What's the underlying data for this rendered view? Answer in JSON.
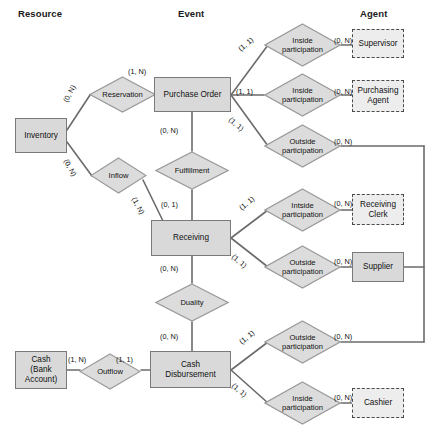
{
  "diagram": {
    "columns": [
      {
        "label": "Resource",
        "x": 18,
        "y": 8
      },
      {
        "label": "Event",
        "x": 178,
        "y": 8
      },
      {
        "label": "Agent",
        "x": 360,
        "y": 8
      }
    ],
    "colors": {
      "entity_fill": "#d9d9d9",
      "entity_border": "#7a7a7a",
      "dashed_fill": "#ededed",
      "dashed_border": "#4a4a4a",
      "diamond_fill": "#dcdcdc",
      "diamond_border": "#9a9a9a",
      "line": "#6b6b6b",
      "text": "#111111",
      "background": "#ffffff"
    },
    "entities": [
      {
        "id": "inventory",
        "label": "Inventory",
        "x": 15,
        "y": 118,
        "w": 52,
        "h": 35,
        "style": "solid"
      },
      {
        "id": "cash",
        "label": "Cash\n(Bank\nAccount)",
        "x": 15,
        "y": 351,
        "w": 52,
        "h": 38,
        "style": "solid"
      },
      {
        "id": "purchase-order",
        "label": "Purchase Order",
        "x": 154,
        "y": 77,
        "w": 77,
        "h": 35,
        "style": "solid"
      },
      {
        "id": "receiving",
        "label": "Receiving",
        "x": 151,
        "y": 220,
        "w": 80,
        "h": 36,
        "style": "solid"
      },
      {
        "id": "cash-disbursement",
        "label": "Cash\nDisbursement",
        "x": 150,
        "y": 351,
        "w": 81,
        "h": 37,
        "style": "solid"
      },
      {
        "id": "supervisor",
        "label": "Supervisor",
        "x": 352,
        "y": 29,
        "w": 52,
        "h": 29,
        "style": "dashed"
      },
      {
        "id": "purchasing-agent",
        "label": "Purchasing\nAgent",
        "x": 352,
        "y": 80,
        "w": 52,
        "h": 32,
        "style": "dashed"
      },
      {
        "id": "receiving-clerk",
        "label": "Receiving\nClerk",
        "x": 352,
        "y": 194,
        "w": 52,
        "h": 31,
        "style": "dashed"
      },
      {
        "id": "supplier",
        "label": "Supplier",
        "x": 352,
        "y": 252,
        "w": 52,
        "h": 30,
        "style": "solid"
      },
      {
        "id": "cashier",
        "label": "Cashier",
        "x": 352,
        "y": 388,
        "w": 52,
        "h": 30,
        "style": "dashed"
      }
    ],
    "relationships": [
      {
        "id": "reservation",
        "label": "Reservation",
        "x": 89,
        "y": 76,
        "w": 67,
        "h": 37
      },
      {
        "id": "inflow",
        "label": "Inflow",
        "x": 90,
        "y": 157,
        "w": 57,
        "h": 37
      },
      {
        "id": "outflow",
        "label": "Outflow",
        "x": 79,
        "y": 353,
        "w": 62,
        "h": 37
      },
      {
        "id": "fulfillment",
        "label": "Fulfillment",
        "x": 155,
        "y": 151,
        "w": 74,
        "h": 39
      },
      {
        "id": "duality",
        "label": "Duality",
        "x": 155,
        "y": 283,
        "w": 74,
        "h": 39
      },
      {
        "id": "po-inside-supervisor",
        "label": "Inside\nparticipation",
        "x": 264,
        "y": 23,
        "w": 77,
        "h": 44
      },
      {
        "id": "po-inside-agent",
        "label": "Inside\nparticipation",
        "x": 264,
        "y": 73,
        "w": 77,
        "h": 44
      },
      {
        "id": "po-outside",
        "label": "Outside\nparticipation",
        "x": 264,
        "y": 124,
        "w": 77,
        "h": 44
      },
      {
        "id": "rcv-inside-clerk",
        "label": "Intside\nparticipation",
        "x": 264,
        "y": 188,
        "w": 77,
        "h": 44
      },
      {
        "id": "rcv-outside-supplier",
        "label": "Outside\nparticipation",
        "x": 264,
        "y": 245,
        "w": 77,
        "h": 44
      },
      {
        "id": "cd-outside",
        "label": "Outside\nparticipation",
        "x": 264,
        "y": 320,
        "w": 77,
        "h": 44
      },
      {
        "id": "cd-inside-cashier",
        "label": "Inside\nparticipation",
        "x": 264,
        "y": 381,
        "w": 77,
        "h": 44
      }
    ],
    "cardinalities": [
      {
        "id": "inv-reservation",
        "text": "(0, N)",
        "x": 62,
        "y": 100,
        "rot": "rot-n62"
      },
      {
        "id": "reservation-po",
        "text": "(1, N)",
        "x": 128,
        "y": 68,
        "rot": ""
      },
      {
        "id": "inv-inflow",
        "text": "(0, N)",
        "x": 69,
        "y": 158,
        "rot": "rot-62"
      },
      {
        "id": "inflow-receiving",
        "text": "(1, N)",
        "x": 137,
        "y": 196,
        "rot": "rot-62"
      },
      {
        "id": "po-fulfillment",
        "text": "(0, N)",
        "x": 160,
        "y": 127,
        "rot": ""
      },
      {
        "id": "fulfillment-receiving",
        "text": "(0, 1)",
        "x": 161,
        "y": 201,
        "rot": ""
      },
      {
        "id": "receiving-duality",
        "text": "(0, N)",
        "x": 160,
        "y": 265,
        "rot": ""
      },
      {
        "id": "duality-cd",
        "text": "(0, N)",
        "x": 160,
        "y": 333,
        "rot": ""
      },
      {
        "id": "cash-outflow",
        "text": "(1, N)",
        "x": 68,
        "y": 356,
        "rot": ""
      },
      {
        "id": "outflow-cd",
        "text": "(1, 1)",
        "x": 116,
        "y": 356,
        "rot": ""
      },
      {
        "id": "po-to-inside-sup",
        "text": "(1, 1)",
        "x": 237,
        "y": 47,
        "rot": "rot-n40"
      },
      {
        "id": "po-to-inside-agent",
        "text": "(1, 1)",
        "x": 236,
        "y": 88,
        "rot": ""
      },
      {
        "id": "po-to-outside",
        "text": "(1, 1)",
        "x": 232,
        "y": 116,
        "rot": "rot-40"
      },
      {
        "id": "inside-sup-to-sup",
        "text": "(0, N)",
        "x": 334,
        "y": 37,
        "rot": ""
      },
      {
        "id": "inside-agent-to-agent",
        "text": "(0, N)",
        "x": 334,
        "y": 88,
        "rot": ""
      },
      {
        "id": "outside-po-card",
        "text": "(0, N)",
        "x": 334,
        "y": 138,
        "rot": ""
      },
      {
        "id": "rcv-to-inside",
        "text": "(1, 1)",
        "x": 238,
        "y": 206,
        "rot": "rot-n40"
      },
      {
        "id": "rcv-to-outside",
        "text": "(1, 1)",
        "x": 235,
        "y": 253,
        "rot": "rot-40"
      },
      {
        "id": "inside-clerk-card",
        "text": "(0, N)",
        "x": 334,
        "y": 200,
        "rot": ""
      },
      {
        "id": "outside-supplier-card",
        "text": "(0, N)",
        "x": 334,
        "y": 258,
        "rot": ""
      },
      {
        "id": "cd-to-outside",
        "text": "(1, 1)",
        "x": 238,
        "y": 340,
        "rot": "rot-n40"
      },
      {
        "id": "cd-to-inside",
        "text": "(1, 1)",
        "x": 235,
        "y": 382,
        "rot": "rot-40"
      },
      {
        "id": "outside-cd-card",
        "text": "(0, N)",
        "x": 334,
        "y": 333,
        "rot": ""
      },
      {
        "id": "inside-cashier-card",
        "text": "(0, N)",
        "x": 334,
        "y": 394,
        "rot": ""
      }
    ],
    "connectors": [
      {
        "id": "inv-to-reservation",
        "points": "67,130 90,95"
      },
      {
        "id": "reservation-to-po",
        "points": "156,95 154,95"
      },
      {
        "id": "inv-to-inflow",
        "points": "67,142 92,176"
      },
      {
        "id": "inflow-to-receiving",
        "points": "143,180 163,221"
      },
      {
        "id": "po-to-fulfillment",
        "points": "192,112 192,151"
      },
      {
        "id": "fulfillment-to-receiving",
        "points": "192,190 192,220"
      },
      {
        "id": "receiving-to-duality",
        "points": "192,256 192,283"
      },
      {
        "id": "duality-to-cd",
        "points": "192,322 192,351"
      },
      {
        "id": "cash-to-outflow",
        "points": "67,370 80,370"
      },
      {
        "id": "outflow-to-cd",
        "points": "141,370 150,370"
      },
      {
        "id": "po-to-d1",
        "points": "231,95 268,45"
      },
      {
        "id": "po-to-d2",
        "points": "231,95 264,95"
      },
      {
        "id": "po-to-d3",
        "points": "231,95 268,146"
      },
      {
        "id": "d1-to-supervisor",
        "points": "341,45 352,45"
      },
      {
        "id": "d2-to-agent",
        "points": "341,95 352,95"
      },
      {
        "id": "d3-to-right-bus",
        "points": "341,146 424,146"
      },
      {
        "id": "rcv-to-d4",
        "points": "231,238 268,210"
      },
      {
        "id": "rcv-to-d5",
        "points": "231,238 268,267"
      },
      {
        "id": "d4-to-clerk",
        "points": "341,210 352,210"
      },
      {
        "id": "d5-to-supplier",
        "points": "341,267 352,267"
      },
      {
        "id": "cd-to-d6",
        "points": "231,370 268,342"
      },
      {
        "id": "cd-to-d7",
        "points": "231,370 268,403"
      },
      {
        "id": "d6-to-right-bus",
        "points": "341,342 424,342"
      },
      {
        "id": "d7-to-cashier",
        "points": "341,403 352,403"
      },
      {
        "id": "right-bus-vertical",
        "points": "424,146 424,342"
      },
      {
        "id": "supplier-to-right-bus",
        "points": "404,267 424,267"
      }
    ]
  }
}
